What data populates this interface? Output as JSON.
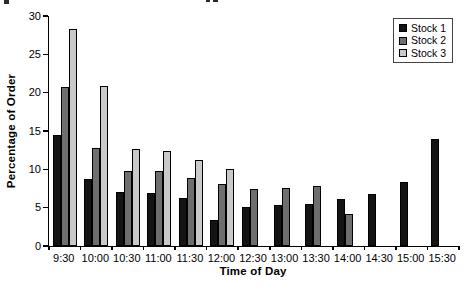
{
  "figure": {
    "background": "#ffffff",
    "axis_color": "#000000"
  },
  "chart_data": {
    "type": "bar",
    "title": "",
    "xlabel": "Time of Day",
    "ylabel": "Percentage of Order",
    "ylim": [
      0,
      30
    ],
    "yticks": [
      0,
      5,
      10,
      15,
      20,
      25,
      30
    ],
    "grid": false,
    "legend_position": "top-right",
    "categories": [
      "9:30",
      "10:00",
      "10:30",
      "11:00",
      "11:30",
      "12:00",
      "12:30",
      "13:00",
      "13:30",
      "14:00",
      "14:30",
      "15:00",
      "15:30"
    ],
    "series": [
      {
        "name": "Stock 1",
        "color": "#141414",
        "values": [
          14.5,
          8.8,
          7.0,
          6.9,
          6.3,
          3.4,
          5.1,
          5.3,
          5.5,
          6.1,
          6.8,
          8.4,
          13.9
        ]
      },
      {
        "name": "Stock 2",
        "color": "#6e6e6e",
        "values": [
          20.8,
          12.8,
          9.8,
          9.8,
          8.9,
          8.1,
          7.4,
          7.6,
          7.8,
          4.2,
          null,
          null,
          null
        ]
      },
      {
        "name": "Stock 3",
        "color": "#c9c9c9",
        "values": [
          28.3,
          20.9,
          12.7,
          12.4,
          11.2,
          10.1,
          null,
          null,
          null,
          null,
          null,
          null,
          null
        ]
      }
    ]
  }
}
